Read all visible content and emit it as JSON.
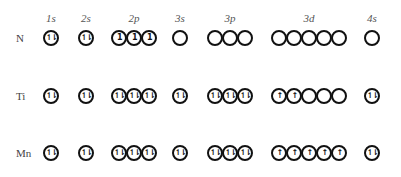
{
  "diagram": {
    "subshells": [
      {
        "label": "1s",
        "x": 51,
        "count": 1
      },
      {
        "label": "2s",
        "x": 86,
        "count": 1
      },
      {
        "label": "2p",
        "x": 134,
        "count": 3
      },
      {
        "label": "3s",
        "x": 180,
        "count": 1
      },
      {
        "label": "3p",
        "x": 230,
        "count": 3
      },
      {
        "label": "3d",
        "x": 309,
        "count": 5
      },
      {
        "label": "4s",
        "x": 372,
        "count": 1
      }
    ],
    "legend": {
      "paired": "⥮",
      "single_up": "↑",
      "single_numeral": "1",
      "empty": ""
    },
    "rows": [
      {
        "element": "N",
        "y": 38,
        "orbitals": {
          "1s": [
            "⥮"
          ],
          "2s": [
            "⥮"
          ],
          "2p": [
            "1",
            "1",
            "1"
          ],
          "3s": [
            ""
          ],
          "3p": [
            "",
            "",
            ""
          ],
          "3d": [
            "",
            "",
            "",
            "",
            ""
          ],
          "4s": [
            ""
          ]
        }
      },
      {
        "element": "Ti",
        "y": 96,
        "orbitals": {
          "1s": [
            "⥮"
          ],
          "2s": [
            "⥮"
          ],
          "2p": [
            "⥮",
            "⥮",
            "⥮"
          ],
          "3s": [
            "⥮"
          ],
          "3p": [
            "⥮",
            "⥮",
            "⥮"
          ],
          "3d": [
            "↑",
            "↑",
            "",
            "",
            ""
          ],
          "4s": [
            "⥮"
          ]
        }
      },
      {
        "element": "Mn",
        "y": 153,
        "orbitals": {
          "1s": [
            "⥮"
          ],
          "2s": [
            "⥮"
          ],
          "2p": [
            "⥮",
            "⥮",
            "⥮"
          ],
          "3s": [
            "⥮"
          ],
          "3p": [
            "⥮",
            "⥮",
            "⥮"
          ],
          "3d": [
            "↑",
            "↑",
            "↑",
            "↑",
            "↑"
          ],
          "4s": [
            "⥮"
          ]
        }
      }
    ]
  }
}
